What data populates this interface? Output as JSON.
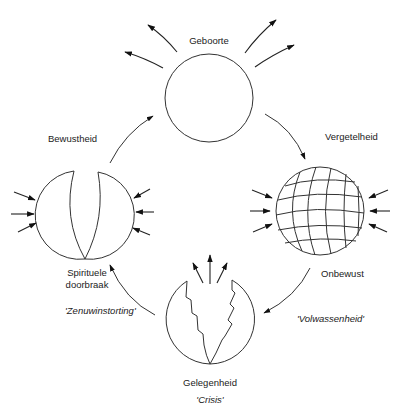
{
  "diagram": {
    "type": "cycle",
    "stages": [
      {
        "id": "top",
        "label": "Geboorte",
        "style": "plain-circle",
        "arrows": "outward"
      },
      {
        "id": "right",
        "label_top": "Vergetelheid",
        "label_bottom": "Onbewust",
        "style": "gridded-sphere",
        "arrows": "inward"
      },
      {
        "id": "bottom",
        "label": "Gelegenheid",
        "sublabel": "'Crisis'",
        "style": "split-jagged",
        "arrows": "upward"
      },
      {
        "id": "left",
        "label_top": "Bewustheid",
        "label_bottom_line1": "Spirituele",
        "label_bottom_line2": "doorbraak",
        "style": "split-crescent",
        "arrows": "inward"
      }
    ],
    "transitions": [
      {
        "from": "top",
        "to": "right"
      },
      {
        "from": "right",
        "to": "bottom",
        "label": "'Volwassenheid'"
      },
      {
        "from": "bottom",
        "to": "left",
        "label": "'Zenuwinstorting'"
      },
      {
        "from": "left",
        "to": "top"
      }
    ]
  },
  "labels": {
    "geboorte": "Geboorte",
    "vergetelheid": "Vergetelheid",
    "onbewust": "Onbewust",
    "bewustheid": "Bewustheid",
    "spirituele": "Spirituele",
    "doorbraak": "doorbraak",
    "gelegenheid": "Gelegenheid",
    "crisis": "'Crisis'",
    "zenuwinstorting": "'Zenuwinstorting'",
    "volwassenheid": "'Volwassenheid'"
  },
  "colors": {
    "line": "#333333",
    "text": "#222222",
    "background": "#ffffff"
  }
}
